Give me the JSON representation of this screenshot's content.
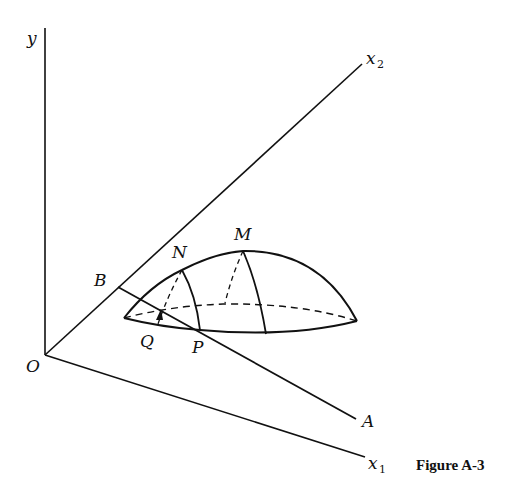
{
  "figure": {
    "caption": "Figure A-3",
    "axes": {
      "y_label": "y",
      "x1_label": "x",
      "x1_sub": "1",
      "x2_label": "x",
      "x2_sub": "2",
      "origin_label": "O"
    },
    "points": {
      "A": "A",
      "B": "B",
      "M": "M",
      "N": "N",
      "P": "P",
      "Q": "Q"
    },
    "colors": {
      "ink": "#111111",
      "background": "#ffffff"
    }
  }
}
